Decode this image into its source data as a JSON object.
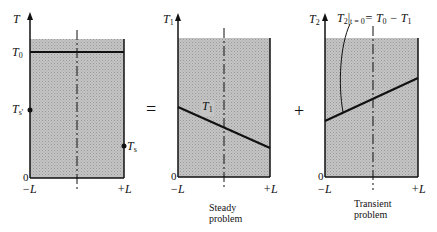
{
  "figure": {
    "operators": {
      "equals": "=",
      "plus": "+"
    },
    "colors": {
      "shade": "#b8b8b8",
      "line": "#111111",
      "background": "#ffffff"
    },
    "panels": [
      {
        "id": "original",
        "y_axis_label": "T",
        "y_axis_sub": "",
        "top_value_label": "T",
        "top_value_sub": "0",
        "left_point_label": "T",
        "left_point_sub": "s'",
        "right_point_label": "T",
        "right_point_sub": "s",
        "origin_label": "0",
        "x_left_label": "−L",
        "x_right_label": "+L",
        "caption": [
          "",
          ""
        ]
      },
      {
        "id": "steady",
        "y_axis_label": "T",
        "y_axis_sub": "1",
        "curve_label": "T",
        "curve_sub": "1",
        "origin_label": "0",
        "x_left_label": "−L",
        "x_right_label": "+L",
        "caption": [
          "Steady",
          "problem"
        ]
      },
      {
        "id": "transient",
        "y_axis_label": "T",
        "y_axis_sub": "2",
        "annotation_main": "T",
        "annotation_sub": "2",
        "annotation_cond": "|",
        "annotation_cond_sub": "t = 0",
        "annotation_rhs": "= T",
        "annotation_rhs_sub": "0",
        "annotation_rhs2": " − T",
        "annotation_rhs2_sub": "1",
        "origin_label": "0",
        "x_left_label": "−L",
        "x_right_label": "+L",
        "caption": [
          "Transient",
          "problem"
        ]
      }
    ]
  }
}
